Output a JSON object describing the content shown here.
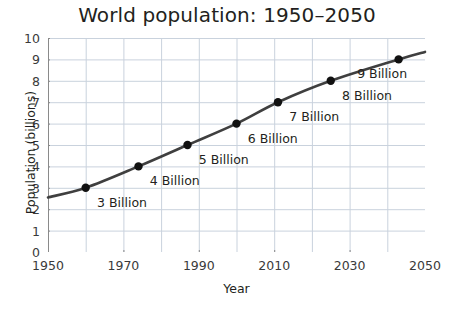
{
  "chart_data": {
    "type": "line",
    "title": "World population: 1950–2050",
    "xlabel": "Year",
    "ylabel": "Population (billions)",
    "xlim": [
      1950,
      2050
    ],
    "ylim": [
      0,
      10
    ],
    "xticks": [
      1950,
      1970,
      1990,
      2010,
      2030,
      2050
    ],
    "xtick_labels": [
      "1950",
      "1970",
      "1990",
      "2010",
      "2030",
      "2050"
    ],
    "yticks": [
      0,
      1,
      2,
      3,
      4,
      5,
      6,
      7,
      8,
      9,
      10
    ],
    "ytick_labels": [
      "0",
      "1",
      "2",
      "3",
      "4",
      "5",
      "6",
      "7",
      "8",
      "9",
      "10"
    ],
    "grid": true,
    "grid_x_step": 10,
    "grid_y_step": 1,
    "legend": "none",
    "line_color": "#3f3f3f",
    "marker_color": "#111111",
    "grid_color": "#c9d2dd",
    "axis_color": "#8a8a8a",
    "background": "#ffffff",
    "series": [
      {
        "name": "World population",
        "x": [
          1950,
          1960,
          1974,
          1987,
          2000,
          2011,
          2025,
          2043,
          2050
        ],
        "y": [
          2.55,
          3.0,
          4.0,
          5.0,
          6.0,
          7.0,
          8.0,
          9.0,
          9.35
        ]
      }
    ],
    "annotations": [
      {
        "label": "3 Billion",
        "x": 1960,
        "y": 3,
        "label_x": 1963,
        "label_y": 2.35
      },
      {
        "label": "4 Billion",
        "x": 1974,
        "y": 4,
        "label_x": 1977,
        "label_y": 3.35
      },
      {
        "label": "5 Billion",
        "x": 1987,
        "y": 5,
        "label_x": 1990,
        "label_y": 4.35
      },
      {
        "label": "6 Billion",
        "x": 2000,
        "y": 6,
        "label_x": 2003,
        "label_y": 5.35
      },
      {
        "label": "7 Billion",
        "x": 2011,
        "y": 7,
        "label_x": 2014,
        "label_y": 6.35
      },
      {
        "label": "8 Billion",
        "x": 2025,
        "y": 8,
        "label_x": 2028,
        "label_y": 7.35
      },
      {
        "label": "9 Billion",
        "x": 2043,
        "y": 9,
        "label_x": 2032,
        "label_y": 8.35
      }
    ]
  }
}
